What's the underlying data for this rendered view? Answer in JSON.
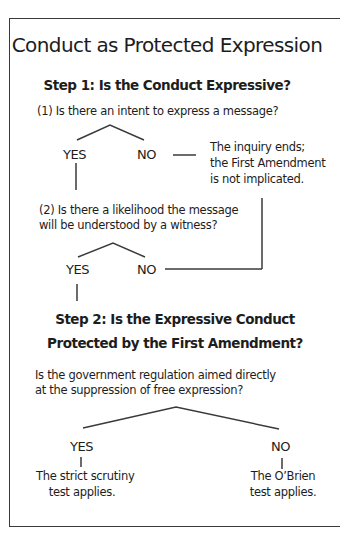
{
  "title": "Conduct as Protected Expression",
  "step1": {
    "heading": "Step 1: Is the Conduct Expressive?",
    "q1": "(1) Is there an intent to express a message?",
    "q1_yes": "YES",
    "q1_no": "NO",
    "end_note": [
      "The inquiry ends;",
      "the First Amendment",
      "is not implicated."
    ],
    "q2": [
      "(2) Is there a likelihood the message",
      "will be understood by a witness?"
    ],
    "q2_yes": "YES",
    "q2_no": "NO"
  },
  "step2": {
    "heading": [
      "Step 2: Is the Expressive Conduct",
      "Protected by the First Amendment?"
    ],
    "question": [
      "Is the government regulation aimed directly",
      "at the suppression of free expression?"
    ],
    "yes": "YES",
    "no": "NO",
    "yes_result": [
      "The strict scrutiny",
      "test applies."
    ],
    "no_result": [
      "The O’Brien",
      "test applies."
    ]
  },
  "colors": {
    "line": "#3a3a3a",
    "text": "#1d1d1d",
    "background": "#ffffff"
  }
}
